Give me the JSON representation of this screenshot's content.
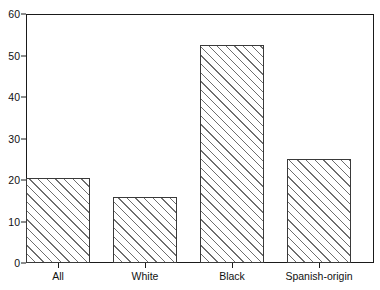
{
  "chart_data": {
    "type": "bar",
    "title": "",
    "xlabel": "",
    "ylabel": "",
    "categories": [
      "All",
      "White",
      "Black",
      "Spanish-origin"
    ],
    "values": [
      20.5,
      16,
      52.5,
      25
    ],
    "ylim": [
      0,
      60
    ],
    "yticks": [
      0,
      10,
      20,
      30,
      40,
      50,
      60
    ],
    "ytick_labels": [
      "0",
      "10",
      "20",
      "30",
      "40",
      "50",
      "60"
    ],
    "grid": false,
    "legend": null,
    "bar_fill": "hatched-diagonal",
    "bar_edge_color": "#3a3a3a",
    "axis_color": "#1a1a1a",
    "background": "#ffffff"
  }
}
